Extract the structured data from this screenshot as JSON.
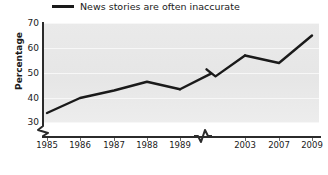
{
  "chart_data": {
    "type": "line",
    "title": "",
    "xlabel": "",
    "ylabel": "Percentage",
    "ylim": [
      30,
      70
    ],
    "yticks": [
      30,
      40,
      50,
      60,
      70
    ],
    "grid": true,
    "legend_position": "top-left",
    "axis_break_x": true,
    "axis_break_y": true,
    "line_break_between": [
      "1989",
      "2003"
    ],
    "categories": [
      "1985",
      "1986",
      "1987",
      "1988",
      "1989",
      "2003",
      "2007",
      "2009"
    ],
    "series": [
      {
        "name": "News stories are often inaccurate",
        "color": "#1a1a1a",
        "values": [
          34,
          40,
          43,
          46.5,
          43.5,
          57,
          54,
          65
        ]
      }
    ]
  },
  "legend": {
    "items": [
      {
        "label": "News stories are often inaccurate",
        "color": "#1a1a1a"
      }
    ]
  },
  "axes": {
    "y": {
      "title": "Percentage",
      "ticks": [
        "30",
        "40",
        "50",
        "60",
        "70"
      ]
    },
    "x": {
      "ticks": [
        "1985",
        "1986",
        "1987",
        "1988",
        "1989",
        "2003",
        "2007",
        "2009"
      ]
    }
  }
}
